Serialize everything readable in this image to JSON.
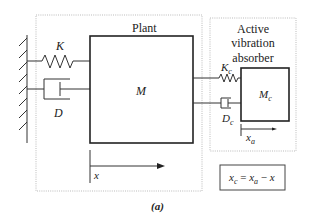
{
  "figure": {
    "caption": "(a)",
    "plant": {
      "title": "Plant",
      "mass_label": "M",
      "spring_label": "K",
      "damper_label": "D",
      "displacement_label": "x"
    },
    "absorber": {
      "title_line1": "Active",
      "title_line2": "vibration",
      "title_line3": "absorber",
      "mass_label": "M",
      "mass_sub": "c",
      "spring_label": "K",
      "spring_sub": "c",
      "damper_label": "D",
      "damper_sub": "c",
      "displacement_label": "x",
      "displacement_sub": "a"
    },
    "equation": {
      "lhs": "x",
      "lhs_sub": "c",
      "eq": " = ",
      "t1": "x",
      "t1_sub": "a",
      "op": " − ",
      "t2": "x"
    }
  }
}
